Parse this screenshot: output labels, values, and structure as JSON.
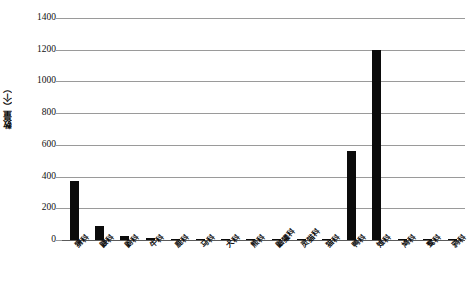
{
  "chart_data": {
    "type": "bar",
    "title": "",
    "xlabel": "",
    "ylabel": "数量（个）",
    "ylim": [
      0,
      1400
    ],
    "yticks": [
      0,
      200,
      400,
      600,
      800,
      1000,
      1200,
      1400
    ],
    "grid": true,
    "legend": "none",
    "bar_color": "#0b0b0b",
    "categories": [
      "猬科",
      "鼹科",
      "鼩科",
      "牛科",
      "鹿科",
      "马科",
      "犬科",
      "熊科",
      "鼬獾科",
      "灵猫科",
      "猫科",
      "鸭科",
      "雉科",
      "鸠科",
      "鹭科",
      "鸦科"
    ],
    "values": [
      370,
      90,
      25,
      12,
      5,
      4,
      3,
      3,
      3,
      2,
      6,
      560,
      1200,
      4,
      3,
      3
    ],
    "series": [
      {
        "name": "数量",
        "values": [
          370,
          90,
          25,
          12,
          5,
          4,
          3,
          3,
          3,
          2,
          6,
          560,
          1200,
          4,
          3,
          3
        ]
      }
    ]
  }
}
